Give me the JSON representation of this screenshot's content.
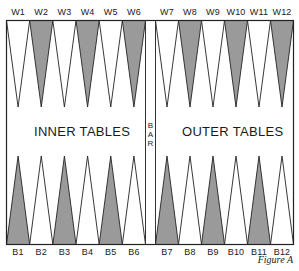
{
  "board": {
    "colors": {
      "dark_point": "#9a9a9a",
      "light_point": "#ffffff",
      "line": "#222222",
      "background": "#ffffff"
    },
    "top_labels": [
      "W1",
      "W2",
      "W3",
      "W4",
      "W5",
      "W6",
      "W7",
      "W8",
      "W9",
      "W10",
      "W11",
      "W12"
    ],
    "bottom_labels": [
      "B1",
      "B2",
      "B3",
      "B4",
      "B5",
      "B6",
      "B7",
      "B8",
      "B9",
      "B10",
      "B11",
      "B12"
    ],
    "top_dark_points": [
      "W2",
      "W4",
      "W6",
      "W8",
      "W10",
      "W12"
    ],
    "bottom_dark_points": [
      "B1",
      "B3",
      "B5",
      "B7",
      "B9",
      "B11"
    ],
    "left_table_title": "INNER TABLES",
    "right_table_title": "OUTER TABLES",
    "bar_letters": [
      "B",
      "A",
      "R"
    ]
  },
  "caption": "Figure A"
}
